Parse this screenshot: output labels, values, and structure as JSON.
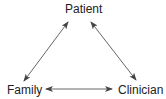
{
  "diagram": {
    "type": "triangle-relationship",
    "nodes": [
      {
        "id": "patient",
        "label": "Patient"
      },
      {
        "id": "family",
        "label": "Family"
      },
      {
        "id": "clinician",
        "label": "Clinician"
      }
    ],
    "edges": [
      {
        "from": "family",
        "to": "patient",
        "direction": "bidirectional"
      },
      {
        "from": "patient",
        "to": "clinician",
        "direction": "bidirectional"
      },
      {
        "from": "family",
        "to": "clinician",
        "direction": "bidirectional"
      }
    ],
    "colors": {
      "line": "#555555",
      "text": "#222222"
    }
  }
}
